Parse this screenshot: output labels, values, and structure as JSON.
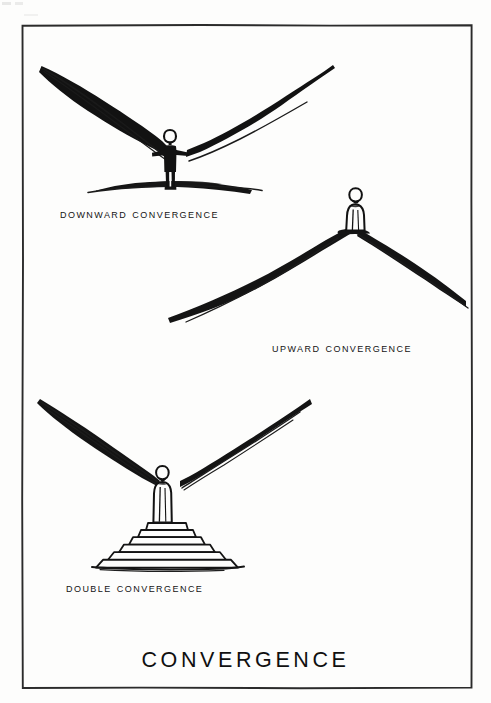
{
  "plate": {
    "title": "CONVERGENCE",
    "border_color": "#2b2b2b",
    "ink_color": "#101010",
    "paper_color": "#fdfdfc",
    "width": 491,
    "height": 703,
    "frame": {
      "left": 22,
      "top": 25,
      "right": 472,
      "bottom": 688
    }
  },
  "scenes": [
    {
      "id": "downward-convergence",
      "caption": "Downward Convergence",
      "description": "Two ridgelines descend from upper left and upper right and converge downward onto a standing silhouetted figure on a flat dark ground line.",
      "figure_style": "solid-black-silhouette-arms-out",
      "ground": "flat dark horizon band"
    },
    {
      "id": "upward-convergence",
      "caption": "Upward Convergence",
      "description": "Two slopes rise from lower left and lower right and converge upward at a summit where an outlined robed figure stands.",
      "figure_style": "outlined-robed-standing",
      "ground": "mountain peak"
    },
    {
      "id": "double-convergence",
      "caption": "Double Convergence",
      "description": "Two ridgelines converge downward onto an outlined robed figure standing atop a stepped pyramid platform of six tiers.",
      "figure_style": "outlined-robed-standing",
      "ground": "stepped pyramid platform",
      "step_count": 6
    }
  ]
}
